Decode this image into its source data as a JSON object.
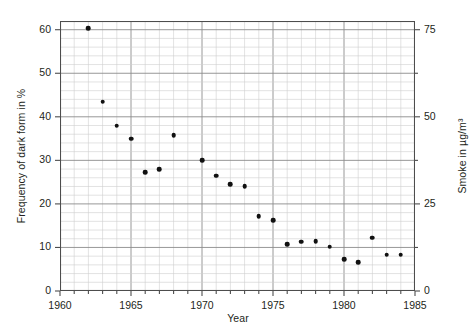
{
  "chart_data": {
    "type": "scatter",
    "title": "",
    "xlabel": "Year",
    "ylabel": "Frequency of dark form in %",
    "ylabel_right": "Smoke in µg/m³",
    "xlim": [
      1960,
      1985
    ],
    "ylim": [
      0,
      62
    ],
    "ylim_right": [
      0,
      77.5
    ],
    "xticks": [
      1960,
      1965,
      1970,
      1975,
      1980,
      1985
    ],
    "xtick_labels": [
      "1960",
      "1965",
      "1970",
      "1975",
      "1980",
      "1985"
    ],
    "yticks": [
      0,
      10,
      20,
      30,
      40,
      50,
      60
    ],
    "ytick_labels": [
      "0",
      "10",
      "20",
      "30",
      "40",
      "50",
      "60"
    ],
    "yticks_right": [
      0,
      25,
      50,
      75
    ],
    "ytick_labels_right": [
      "0",
      "25",
      "50",
      "75"
    ],
    "grid": true,
    "grid_major_x_step": 5,
    "grid_minor_x_step": 1,
    "grid_major_y_step": 10,
    "grid_minor_y_step": 2,
    "legend": "none",
    "marker": "filled-circle",
    "marker_color": "#111111",
    "x": [
      1962,
      1963,
      1964,
      1965,
      1966,
      1967,
      1968,
      1970,
      1971,
      1972,
      1973,
      1974,
      1975,
      1976,
      1977,
      1978,
      1979,
      1980,
      1981,
      1982,
      1983,
      1984
    ],
    "y": [
      60.3,
      43.5,
      38.0,
      35.0,
      27.3,
      28.0,
      35.8,
      30.0,
      26.5,
      24.5,
      24.0,
      17.2,
      16.3,
      10.8,
      11.3,
      11.5,
      10.2,
      7.3,
      6.6,
      12.2,
      8.3,
      8.3
    ],
    "points": [
      {
        "year": 1962,
        "frequency_percent": 60.3,
        "smoke_ug_m3": 75.4
      },
      {
        "year": 1963,
        "frequency_percent": 43.5,
        "smoke_ug_m3": 54.4
      },
      {
        "year": 1964,
        "frequency_percent": 38.0,
        "smoke_ug_m3": 47.5
      },
      {
        "year": 1965,
        "frequency_percent": 35.0,
        "smoke_ug_m3": 43.8
      },
      {
        "year": 1966,
        "frequency_percent": 27.3,
        "smoke_ug_m3": 34.1
      },
      {
        "year": 1967,
        "frequency_percent": 28.0,
        "smoke_ug_m3": 35.0
      },
      {
        "year": 1968,
        "frequency_percent": 35.8,
        "smoke_ug_m3": 44.8
      },
      {
        "year": 1970,
        "frequency_percent": 30.0,
        "smoke_ug_m3": 37.5
      },
      {
        "year": 1971,
        "frequency_percent": 26.5,
        "smoke_ug_m3": 33.1
      },
      {
        "year": 1972,
        "frequency_percent": 24.5,
        "smoke_ug_m3": 30.6
      },
      {
        "year": 1973,
        "frequency_percent": 24.0,
        "smoke_ug_m3": 30.0
      },
      {
        "year": 1974,
        "frequency_percent": 17.2,
        "smoke_ug_m3": 21.5
      },
      {
        "year": 1975,
        "frequency_percent": 16.3,
        "smoke_ug_m3": 20.4
      },
      {
        "year": 1976,
        "frequency_percent": 10.8,
        "smoke_ug_m3": 13.5
      },
      {
        "year": 1977,
        "frequency_percent": 11.3,
        "smoke_ug_m3": 14.1
      },
      {
        "year": 1978,
        "frequency_percent": 11.5,
        "smoke_ug_m3": 14.4
      },
      {
        "year": 1979,
        "frequency_percent": 10.2,
        "smoke_ug_m3": 12.8
      },
      {
        "year": 1980,
        "frequency_percent": 7.3,
        "smoke_ug_m3": 9.1
      },
      {
        "year": 1981,
        "frequency_percent": 6.6,
        "smoke_ug_m3": 8.3
      },
      {
        "year": 1982,
        "frequency_percent": 12.2,
        "smoke_ug_m3": 15.3
      },
      {
        "year": 1983,
        "frequency_percent": 8.3,
        "smoke_ug_m3": 10.4
      },
      {
        "year": 1984,
        "frequency_percent": 8.3,
        "smoke_ug_m3": 10.4
      }
    ]
  },
  "axes": {
    "xlabel": "Year",
    "ylabel_left": "Frequency of dark form in %",
    "ylabel_right": "Smoke in µg/m³"
  },
  "colors": {
    "marker": "#111111",
    "frame": "#4d4d4d",
    "grid_major": "#8c8c8c",
    "grid_minor": "#cfcfcf",
    "text": "#231f20",
    "background": "#ffffff"
  }
}
